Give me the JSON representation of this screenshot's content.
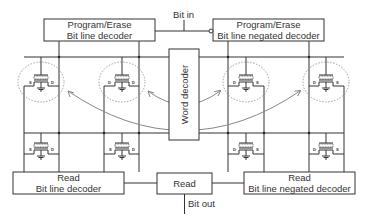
{
  "diagram": {
    "blocks": {
      "pe_decoder": {
        "line1": "Program/Erase",
        "line2": "Bit line decoder"
      },
      "pe_negated_decoder": {
        "line1": "Program/Erase",
        "line2": "Bit line negated decoder"
      },
      "word_decoder": {
        "label": "Word decoder"
      },
      "read_decoder": {
        "line1": "Read",
        "line2": "Bit line decoder"
      },
      "read_center": {
        "label": "Read"
      },
      "read_negated_decoder": {
        "line1": "Read",
        "line2": "Bit line negated decoder"
      }
    },
    "signals": {
      "bit_in": "Bit in",
      "bit_out": "Bit out"
    },
    "transistor_pins": {
      "source": "S",
      "drain": "D"
    },
    "colors": {
      "line": "#333333",
      "dashed_circle": "#888888",
      "arrow": "#888888"
    }
  }
}
